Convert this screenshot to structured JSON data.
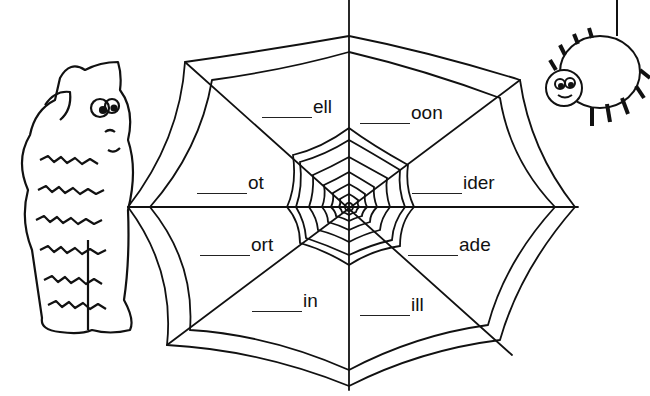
{
  "worksheet": {
    "colors": {
      "ink": "#111111",
      "paper": "#ffffff"
    },
    "words": [
      {
        "id": "ell",
        "suffix": "ell",
        "blank": "_____",
        "x": 262,
        "y": 96
      },
      {
        "id": "oon",
        "suffix": "oon",
        "blank": "_____",
        "x": 360,
        "y": 102
      },
      {
        "id": "ot",
        "suffix": "ot",
        "blank": "_____",
        "x": 197,
        "y": 172
      },
      {
        "id": "ider",
        "suffix": "ider",
        "blank": "_____",
        "x": 412,
        "y": 172
      },
      {
        "id": "ort",
        "suffix": "ort",
        "blank": "_____",
        "x": 200,
        "y": 234
      },
      {
        "id": "ade",
        "suffix": "ade",
        "blank": "_____",
        "x": 408,
        "y": 234
      },
      {
        "id": "in",
        "suffix": "in",
        "blank": "_____",
        "x": 252,
        "y": 290
      },
      {
        "id": "ill",
        "suffix": "ill",
        "blank": "_____",
        "x": 360,
        "y": 294
      }
    ],
    "illustrations": [
      {
        "name": "monster-illustration",
        "description": "furry monster scratching head"
      },
      {
        "name": "spider-illustration",
        "description": "smiling spider hanging on thread"
      }
    ]
  }
}
